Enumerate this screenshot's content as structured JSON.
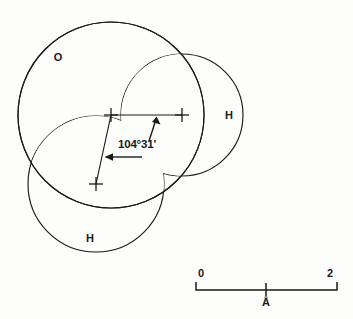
{
  "figure": {
    "background_color": "#fdfdfc",
    "line_color": "#1a1a1a"
  },
  "atoms": [
    {
      "id": "oxygen",
      "label": "O",
      "label_x": 58,
      "label_y": 61,
      "center_x": 111,
      "center_y": 115,
      "radius": 93
    },
    {
      "id": "hydrogen-right",
      "label": "H",
      "label_x": 229,
      "label_y": 119,
      "center_x": 182,
      "center_y": 115,
      "radius": 61
    },
    {
      "id": "hydrogen-lower",
      "label": "H",
      "label_x": 90,
      "label_y": 242,
      "center_x": 96,
      "center_y": 184,
      "radius": 68
    }
  ],
  "nuclei_markers": [
    {
      "id": "oxygen-nucleus",
      "x": 111,
      "y": 115
    },
    {
      "id": "hydrogen-right-nucleus",
      "x": 182,
      "y": 115
    },
    {
      "id": "hydrogen-lower-nucleus",
      "x": 96,
      "y": 184
    }
  ],
  "bonds": [
    {
      "id": "bond-o-h-right",
      "x1": 111,
      "y1": 115,
      "x2": 182,
      "y2": 115
    },
    {
      "id": "bond-o-h-lower",
      "x1": 111,
      "y1": 115,
      "x2": 96,
      "y2": 184
    }
  ],
  "annotation": {
    "angle_text": "104°31'",
    "angle_label_x": 118,
    "angle_label_y": 148,
    "arrow_to_horizontal_bond": {
      "tail_x": 149,
      "tail_y": 141,
      "tip_x": 156,
      "tip_y": 119
    },
    "arrow_to_diagonal_bond": {
      "tail_x": 142,
      "tail_y": 157,
      "tip_x": 106,
      "tip_y": 157
    }
  },
  "scale_bar": {
    "left_label": "0",
    "right_label": "2",
    "unit_label": "Å",
    "x_start": 196,
    "x_end": 337,
    "y_baseline": 290,
    "tick_x": 266,
    "left_label_x": 198,
    "right_label_x": 333,
    "label_y": 277,
    "unit_label_x": 266,
    "unit_label_y": 306
  }
}
